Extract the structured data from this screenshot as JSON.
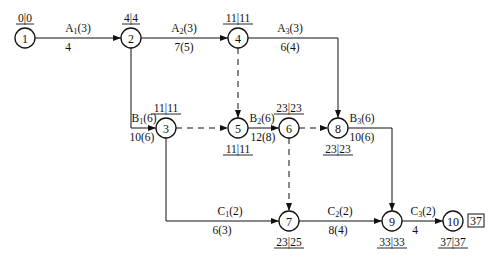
{
  "diagram": {
    "type": "double-code network (arrow diagram) with time parameters",
    "nodes": [
      {
        "id": "1",
        "x": 25,
        "y": 38,
        "times": "0|0",
        "times_pos": "above"
      },
      {
        "id": "2",
        "x": 131,
        "y": 38,
        "times": "4|4",
        "times_pos": "above"
      },
      {
        "id": "4",
        "x": 238,
        "y": 38,
        "times": "11|11",
        "times_pos": "above"
      },
      {
        "id": "3",
        "x": 166,
        "y": 128,
        "times": "11|11",
        "times_pos": "above"
      },
      {
        "id": "5",
        "x": 238,
        "y": 128,
        "times": "11|11",
        "times_pos": "below"
      },
      {
        "id": "6",
        "x": 289,
        "y": 128,
        "times": "23|23",
        "times_pos": "above"
      },
      {
        "id": "8",
        "x": 338,
        "y": 128,
        "times": "23|23",
        "times_pos": "below"
      },
      {
        "id": "7",
        "x": 289,
        "y": 221,
        "times": "23|25",
        "times_pos": "below"
      },
      {
        "id": "9",
        "x": 392,
        "y": 221,
        "times": "33|33",
        "times_pos": "below"
      },
      {
        "id": "10",
        "x": 453,
        "y": 221,
        "times": "37|37",
        "times_pos": "below"
      }
    ],
    "activities": [
      {
        "name": "A",
        "sub": "1",
        "dur": "(3)",
        "label_bottom": "4",
        "from": "1",
        "to": "2"
      },
      {
        "name": "A",
        "sub": "2",
        "dur": "(3)",
        "label_bottom": "7(5)",
        "from": "2",
        "to": "4"
      },
      {
        "name": "A",
        "sub": "3",
        "dur": "(3)",
        "label_bottom": "6(4)",
        "from": "4",
        "to": "8"
      },
      {
        "name": "B",
        "sub": "1",
        "dur": "(6)",
        "label_bottom": "10(6)",
        "from": "2",
        "to": "3"
      },
      {
        "name": "B",
        "sub": "2",
        "dur": "(6)",
        "label_bottom": "12(8)",
        "from": "5",
        "to": "6"
      },
      {
        "name": "B",
        "sub": "3",
        "dur": "(6)",
        "label_bottom": "10(6)",
        "from": "8",
        "to": "9"
      },
      {
        "name": "C",
        "sub": "1",
        "dur": "(2)",
        "label_bottom": "6(3)",
        "from": "3",
        "to": "7"
      },
      {
        "name": "C",
        "sub": "2",
        "dur": "(2)",
        "label_bottom": "8(4)",
        "from": "7",
        "to": "9"
      },
      {
        "name": "C",
        "sub": "3",
        "dur": "(2)",
        "label_bottom": "4",
        "from": "9",
        "to": "10"
      }
    ],
    "dummies": [
      {
        "from": "4",
        "to": "5"
      },
      {
        "from": "3",
        "to": "5"
      },
      {
        "from": "6",
        "to": "8"
      },
      {
        "from": "6",
        "to": "7"
      }
    ],
    "project_duration": "37"
  }
}
